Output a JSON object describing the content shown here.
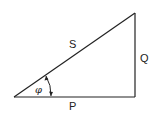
{
  "diagram": {
    "type": "power-triangle",
    "labels": {
      "hypotenuse": "S",
      "vertical": "Q",
      "horizontal": "P",
      "angle": "φ"
    },
    "colors": {
      "line": "#222222",
      "background": "#ffffff"
    }
  }
}
